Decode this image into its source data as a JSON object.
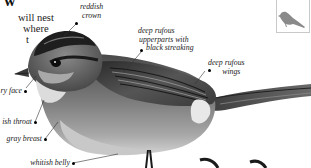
{
  "header": {
    "title_fragment": "w",
    "body_lines": [
      "will nest",
      "where",
      "t"
    ]
  },
  "annotations": [
    {
      "id": "crown",
      "lines": [
        "reddish",
        "crown"
      ]
    },
    {
      "id": "upperparts",
      "lines": [
        "deep rufous",
        "upperparts with",
        "black streaking"
      ]
    },
    {
      "id": "wings",
      "lines": [
        "deep rufous",
        "wings"
      ]
    },
    {
      "id": "face",
      "lines": [
        "ry face"
      ]
    },
    {
      "id": "throat",
      "lines": [
        "ish throat"
      ]
    },
    {
      "id": "breast",
      "lines": [
        "gray breast"
      ]
    },
    {
      "id": "belly",
      "lines": [
        "whitish belly"
      ]
    }
  ],
  "inset": {
    "icon": "bird-silhouette-icon",
    "color": "#8a8a8a"
  },
  "illustration": {
    "subject": "sparrow",
    "palette": [
      "#1c1c1c",
      "#5a5a5a",
      "#9a9a9a",
      "#d8d8d8",
      "#f2f2f2"
    ]
  }
}
